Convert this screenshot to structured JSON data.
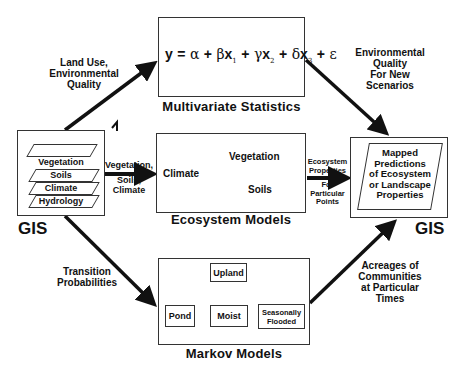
{
  "diagram": {
    "left_gis": {
      "label": "GIS",
      "layers": [
        "Vegetation",
        "Soils",
        "Climate",
        "Hydrology"
      ]
    },
    "right_gis": {
      "label": "GIS",
      "content": [
        "Mapped",
        "Predictions",
        "of Ecosystem",
        "or Landscape",
        "Properties"
      ]
    },
    "multivariate": {
      "caption": "Multivariate Statistics",
      "equation": "y = α + βx1 + γx2 + δx3 + ε",
      "eq_parts": {
        "y": "y",
        "eq": "=",
        "alpha": "α",
        "plus": "+",
        "beta": "β",
        "x": "x",
        "gamma": "γ",
        "delta": "δ",
        "eps": "ε",
        "s1": "1",
        "s2": "2",
        "s3": "3"
      }
    },
    "ecosystem": {
      "caption": "Ecosystem Models",
      "nodes": [
        "Climate",
        "Vegetation",
        "Soils"
      ]
    },
    "markov": {
      "caption": "Markov Models",
      "nodes": [
        "Upland",
        "Pond",
        "Moist",
        "Seasonally Flooded"
      ],
      "seasonally_lines": [
        "Seasonally",
        "Flooded"
      ]
    },
    "arrows": {
      "gis_to_multivariate": [
        "Land Use,",
        "Environmental",
        "Quality"
      ],
      "gis_to_ecosystem": [
        "Vegetation,",
        "Soils,",
        "Climate"
      ],
      "gis_to_markov": [
        "Transition",
        "Probabilities"
      ],
      "multivariate_to_gis": [
        "Environmental",
        "Quality",
        "For New",
        "Scenarios"
      ],
      "ecosystem_to_gis": [
        "Ecosystem",
        "Properties",
        "For",
        "Particular",
        "Points"
      ],
      "markov_to_gis": [
        "Acreages of",
        "Communities",
        "at Particular",
        "Times"
      ]
    }
  }
}
